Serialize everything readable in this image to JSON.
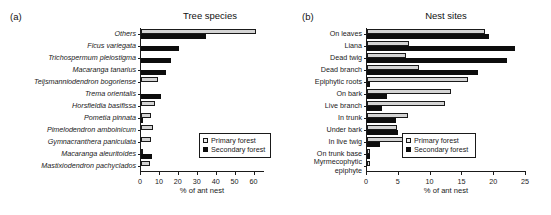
{
  "figure": {
    "panel_a_tag": "(a)",
    "panel_b_tag": "(b)",
    "legend": {
      "primary": "Primary forest",
      "secondary": "Secondary forest"
    }
  },
  "chart_data": [
    {
      "type": "bar",
      "orientation": "horizontal",
      "panel": "(a)",
      "title": "Tree species",
      "xlabel": "% of ant nest",
      "ylabel": "",
      "xlim": [
        0,
        65
      ],
      "xticks": [
        0,
        10,
        20,
        30,
        40,
        50,
        60
      ],
      "grid": false,
      "legend_position": "lower-right",
      "categories": [
        "Others",
        "Ficus variegata",
        "Trichospermum pleiostigma",
        "Macaranga tanarius",
        "Teijsmanniodendron bogoriense",
        "Trema orientalis",
        "Horsfieldia basifissa",
        "Pometia pinnata",
        "Pimelodendron amboinicum",
        "Gymnacranthera paniculata",
        "Macaranga aleuritoides",
        "Mastixiodendron pachyclados"
      ],
      "categories_italic": true,
      "series": [
        {
          "name": "Primary forest",
          "color": "#d4d4d4",
          "values": [
            61.0,
            0.0,
            0.0,
            0.0,
            8.8,
            0.0,
            7.2,
            5.4,
            6.2,
            5.3,
            0.6,
            4.8
          ]
        },
        {
          "name": "Secondary forest",
          "color": "#0d0d0d",
          "values": [
            34.3,
            20.0,
            15.6,
            13.2,
            0.0,
            10.5,
            0.0,
            1.0,
            0.0,
            0.0,
            6.0,
            0.0
          ]
        }
      ]
    },
    {
      "type": "bar",
      "orientation": "horizontal",
      "panel": "(b)",
      "title": "Nest sites",
      "xlabel": "% of ant nest",
      "ylabel": "",
      "xlim": [
        0,
        25
      ],
      "xticks": [
        0,
        5,
        10,
        15,
        20,
        25
      ],
      "grid": false,
      "legend_position": "lower-right",
      "categories": [
        "On leaves",
        "Liana",
        "Dead twig",
        "Dead branch",
        "Epiphytic roots",
        "On bark",
        "Live branch",
        "In trunk",
        "Under bark",
        "In live twig",
        "On trunk base",
        "Myrmecophytic epiphyte"
      ],
      "categories_italic": false,
      "series": [
        {
          "name": "Primary forest",
          "color": "#d4d4d4",
          "values": [
            18.6,
            6.6,
            6.2,
            8.2,
            15.9,
            13.2,
            12.3,
            6.4,
            4.7,
            6.0,
            0.4,
            0.4
          ]
        },
        {
          "name": "Secondary forest",
          "color": "#0d0d0d",
          "values": [
            19.2,
            23.2,
            22.0,
            17.5,
            0.5,
            3.2,
            2.3,
            4.5,
            4.8,
            2.1,
            0.4,
            0.0
          ]
        }
      ]
    }
  ]
}
